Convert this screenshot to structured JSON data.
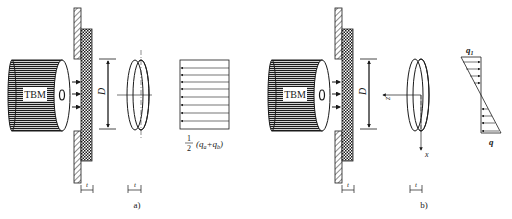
{
  "panels": [
    {
      "id": "a",
      "caption": "a)",
      "machine_label": "TBM",
      "diameter_label": "D",
      "thickness_label_wall": "t",
      "thickness_label_disc": "t",
      "load_label": {
        "fraction_num": "1",
        "fraction_den": "2",
        "expr": "(q",
        "sub1": "a",
        "plus": "+q",
        "sub2": "b",
        "close": ")"
      }
    },
    {
      "id": "b",
      "caption": "b)",
      "machine_label": "TBM",
      "diameter_label": "D",
      "thickness_label_wall": "t",
      "thickness_label_disc": "t",
      "axis_z": "z",
      "axis_x": "x",
      "load_top": "q",
      "load_top_sub": "1",
      "load_bottom": "q"
    }
  ],
  "colors": {
    "ink": "#1a1a1a",
    "background": "#ffffff"
  }
}
